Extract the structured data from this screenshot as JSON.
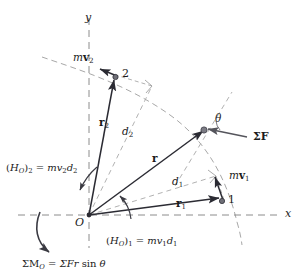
{
  "figure": {
    "colors": {
      "solid_vector": "#2b2b33",
      "dashed_guide": "#9a9a9a",
      "axis_dash": "#8c8c8c",
      "text": "#1b1b1b",
      "point_fill": "#6f6f78"
    }
  },
  "axes": {
    "y_label": "y",
    "x_label": "x",
    "origin_label": "O"
  },
  "points": {
    "point1_label": "1",
    "point2_label": "2"
  },
  "vectors": {
    "r": {
      "base": "r",
      "sub": ""
    },
    "r1": {
      "base": "r",
      "sub": "1"
    },
    "r2": {
      "base": "r",
      "sub": "2"
    },
    "mv1": {
      "m": "m",
      "v": "v",
      "sub": "1"
    },
    "mv2": {
      "m": "m",
      "v": "v",
      "sub": "2"
    },
    "sumF": {
      "text": "ΣF"
    }
  },
  "distances": {
    "d1": {
      "base": "d",
      "sub": "1"
    },
    "d2": {
      "base": "d",
      "sub": "2"
    }
  },
  "angle": {
    "theta": "θ"
  },
  "equations": {
    "h1": {
      "lhs_open": "(",
      "lhs_h": "H",
      "lhs_hsub": "O",
      "lhs_close": ")",
      "lhs_index": "1",
      "eq": "=",
      "rhs_m": "m",
      "rhs_v": "v",
      "rhs_vsub": "1",
      "rhs_d": "d",
      "rhs_dsub": "1",
      "plain": "(H_O)_1 = mv_1 d_1"
    },
    "h2": {
      "lhs_open": "(",
      "lhs_h": "H",
      "lhs_hsub": "O",
      "lhs_close": ")",
      "lhs_index": "2",
      "eq": "=",
      "rhs_m": "m",
      "rhs_v": "v",
      "rhs_vsub": "2",
      "rhs_d": "d",
      "rhs_dsub": "2",
      "plain": "(H_O)_2 = mv_2 d_2"
    },
    "moment": {
      "sigma_m": "ΣM",
      "m_sub": "O",
      "eq": "=",
      "rhs": "ΣFr",
      "sin": "sin",
      "theta": "θ",
      "plain": "ΣM_O = ΣFr sin θ"
    }
  },
  "marks": {
    "right_angle_2": "right-angle",
    "right_angle_1": "right-angle",
    "arc_h2": "counterclockwise-arc",
    "arc_h1": "counterclockwise-arc",
    "arc_moment": "clockwise-arc"
  }
}
